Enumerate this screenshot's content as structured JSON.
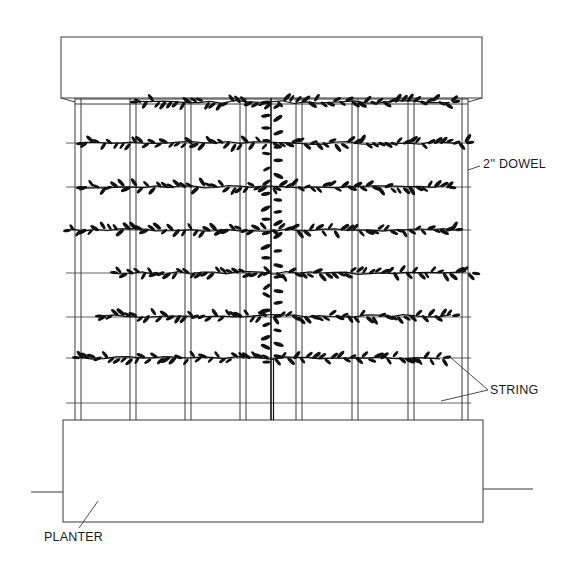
{
  "labels": {
    "dowel": "2'' DOWEL",
    "string": "STRING",
    "planter": "PLANTER"
  },
  "colors": {
    "line": "#3a3a3a",
    "leaf": "#111111",
    "background": "#ffffff"
  },
  "structure": {
    "top_beam": {
      "x": 61,
      "y": 37,
      "w": 421,
      "h": 61
    },
    "planter_box": {
      "x": 63,
      "y": 420,
      "w": 420,
      "h": 102
    },
    "ground_left": [
      31,
      492,
      63,
      492
    ],
    "ground_right": [
      483,
      489,
      533,
      489
    ],
    "dowels_x": [
      75,
      130,
      185,
      240,
      296,
      352,
      408,
      462
    ],
    "dowel_width": 6,
    "rail_y": [
      99,
      104
    ],
    "strings_y": [
      143,
      187,
      230,
      273,
      317,
      358,
      403
    ],
    "string_x_range": [
      66,
      471
    ],
    "stem": {
      "x": 272,
      "y_top": 98,
      "y_bottom": 420
    }
  },
  "vine_rows": [
    {
      "y": 102,
      "x_start": 138,
      "x_end": 452
    },
    {
      "y": 143,
      "x_start": 84,
      "x_end": 466
    },
    {
      "y": 187,
      "x_start": 84,
      "x_end": 448
    },
    {
      "y": 230,
      "x_start": 71,
      "x_end": 455
    },
    {
      "y": 273,
      "x_start": 118,
      "x_end": 472
    },
    {
      "y": 316,
      "x_start": 103,
      "x_end": 452
    },
    {
      "y": 358,
      "x_start": 80,
      "x_end": 443
    }
  ]
}
